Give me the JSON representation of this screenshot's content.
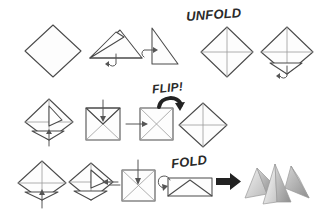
{
  "page": {
    "background_color": "#ffffff",
    "ink_color": "#4a4a4a",
    "label_color": "#2a2a2a",
    "width": 322,
    "height": 215
  },
  "labels": [
    {
      "id": "unfold",
      "text": "UNFOLD",
      "x": 186,
      "y": 8,
      "size": 13,
      "rotation": -4
    },
    {
      "id": "flip",
      "text": "FLIP!",
      "x": 152,
      "y": 83,
      "size": 12,
      "rotation": -6
    },
    {
      "id": "fold",
      "text": "FOLD",
      "x": 171,
      "y": 155,
      "size": 13,
      "rotation": -7
    }
  ],
  "rows": [
    {
      "id": "row-1",
      "steps": [
        {
          "id": "step-1",
          "name": "square-diamond",
          "description": "Plain square sheet oriented as a diamond"
        },
        {
          "id": "step-2",
          "name": "triangle-fold",
          "description": "Folded into a triangle with top flap and curved fold arrow"
        },
        {
          "id": "step-3",
          "name": "right-triangle-fold",
          "description": "Folded again into a smaller right triangle with fold arrow"
        },
        {
          "id": "step-4",
          "name": "unfolded-diamond-creases",
          "description": "Unfolded diamond showing both diagonal crease lines"
        },
        {
          "id": "step-5",
          "name": "diamond-bottom-flap",
          "description": "Diamond with bottom corner flap folded up and fold arrow"
        }
      ]
    },
    {
      "id": "row-2",
      "steps": [
        {
          "id": "step-6",
          "name": "diamond-two-flaps",
          "description": "Diamond with two corner flaps folded in, fold arrow below"
        },
        {
          "id": "step-7",
          "name": "square-crossed-top-arrow",
          "description": "Square with crossed creases and downward fold arrow at top"
        },
        {
          "id": "step-8",
          "name": "square-crossed-side-arrow",
          "description": "Square with X creases and side fold arrow"
        },
        {
          "id": "step-9",
          "name": "diamond-creases-flipped",
          "description": "Flipped diamond with cross creases"
        }
      ]
    },
    {
      "id": "row-3",
      "steps": [
        {
          "id": "step-10",
          "name": "diamond-flap-up-arrow",
          "description": "Diamond with bottom flap and upward push arrow"
        },
        {
          "id": "step-11",
          "name": "diamond-side-flap",
          "description": "Diamond with side flap folded and horizontal arrow"
        },
        {
          "id": "step-12",
          "name": "square-crossed-push-down",
          "description": "Square with X creases and downward push arrow"
        },
        {
          "id": "step-13",
          "name": "flat-envelope-fold",
          "description": "Flattened envelope shape with curled fold arrow"
        }
      ]
    }
  ],
  "arrow": {
    "id": "result-arrow",
    "name": "right-arrow",
    "glyph": "right-arrow"
  },
  "result": {
    "id": "finished-model",
    "name": "finished-origami-model",
    "description": "Completed grey shaded multi-peak origami form",
    "shade_light": "#f0f0f0",
    "shade_mid": "#c9c9c9",
    "shade_dark": "#9d9d9d",
    "shade_darker": "#868686"
  }
}
